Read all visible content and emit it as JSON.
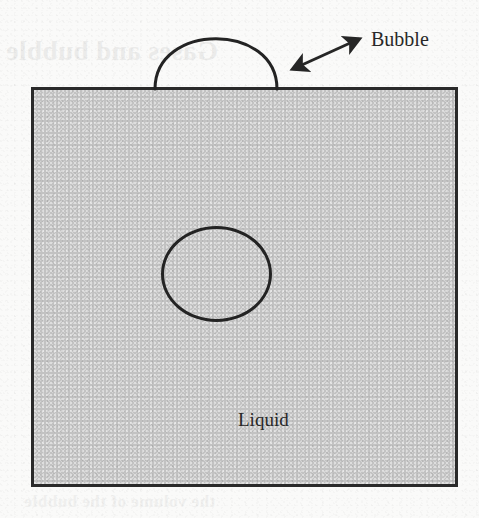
{
  "figure": {
    "type": "schematic-diagram",
    "background_color": "#fafaf9",
    "ink_color": "#282828",
    "liquid_fill_color": "#c2c2c2"
  },
  "labels": {
    "bubble": "Bubble",
    "liquid": "Liquid"
  },
  "shapes": {
    "liquid_rect": {
      "name": "liquid-body",
      "x": 31,
      "y": 87,
      "width": 427,
      "height": 400,
      "fill": "#c2c2c2",
      "stroke": "#2a2a2a",
      "stroke_width": 3
    },
    "surface_bubble_dome": {
      "name": "surface-bubble",
      "left_foot_x": 155,
      "right_foot_x": 277,
      "baseline_y": 88,
      "apex_y": 38,
      "stroke": "#232323",
      "stroke_width": 3
    },
    "interior_bubble": {
      "name": "interior-bubble",
      "cx": 216,
      "cy": 274,
      "rx": 55,
      "ry": 48,
      "stroke": "#232323",
      "stroke_width": 3
    },
    "callout_arrow": {
      "name": "bubble-callout-arrow",
      "x1": 292,
      "y1": 69,
      "x2": 360,
      "y2": 38,
      "double_headed": true,
      "stroke": "#262626",
      "stroke_width": 3
    }
  },
  "ghost_text": {
    "line_1": "Gases and bubble",
    "line_2": "in a liquid",
    "line_3": "the volume of the bubble"
  }
}
